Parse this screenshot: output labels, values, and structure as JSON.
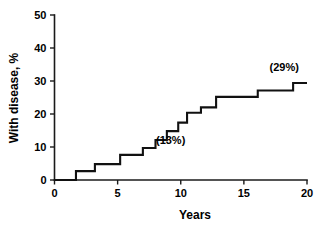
{
  "chart_data": {
    "type": "line",
    "subtype": "step-cumulative-incidence",
    "title": "",
    "xlabel": "Years",
    "ylabel": "With disease, %",
    "xlim": [
      0,
      20
    ],
    "ylim": [
      0,
      50
    ],
    "xticks": [
      0,
      5,
      10,
      15,
      20
    ],
    "xtick_labels": [
      "0",
      "5",
      "10",
      "15",
      "20"
    ],
    "yticks": [
      0,
      10,
      20,
      30,
      40,
      50
    ],
    "ytick_labels": [
      "0",
      "10",
      "20",
      "30",
      "40",
      "50"
    ],
    "grid": false,
    "legend": null,
    "series": [
      {
        "name": "Cumulative incidence of disease",
        "step": "post",
        "x": [
          0.0,
          1.7,
          3.2,
          5.2,
          7.0,
          8.0,
          8.9,
          9.8,
          10.5,
          11.6,
          12.8,
          16.1,
          18.9,
          20.0
        ],
        "y": [
          0.0,
          2.7,
          4.8,
          7.6,
          9.7,
          12.1,
          14.8,
          17.4,
          20.4,
          22.0,
          25.2,
          27.1,
          29.4,
          29.4
        ]
      }
    ],
    "annotations": [
      {
        "text": "(13%)",
        "x": 9.2,
        "y": 11.0
      },
      {
        "text": "(29%)",
        "x": 18.2,
        "y": 33.0
      }
    ]
  },
  "axes": {
    "y_title": "With disease, %",
    "x_title": "Years"
  }
}
